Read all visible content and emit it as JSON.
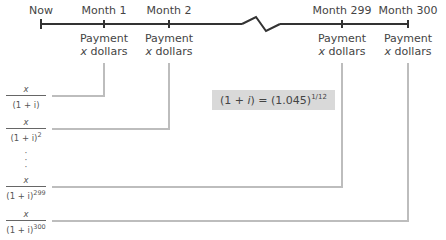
{
  "timeline": {
    "points": [
      {
        "label": "Now"
      },
      {
        "label": "Month 1",
        "payment": "Payment",
        "amount": "dollars",
        "var": "x"
      },
      {
        "label": "Month 2",
        "payment": "Payment",
        "amount": "dollars",
        "var": "x"
      },
      {
        "label": "Month 299",
        "payment": "Payment",
        "amount": "dollars",
        "var": "x"
      },
      {
        "label": "Month 300",
        "payment": "Payment",
        "amount": "dollars",
        "var": "x"
      }
    ]
  },
  "present_values": [
    {
      "numerator": "x",
      "denominator": "(1 + i)",
      "exponent": ""
    },
    {
      "numerator": "x",
      "denominator": "(1 + i)",
      "exponent": "2"
    },
    {
      "numerator": "x",
      "denominator": "(1 + i)",
      "exponent": "299"
    },
    {
      "numerator": "x",
      "denominator": "(1 + i)",
      "exponent": "300"
    }
  ],
  "equation": {
    "lhs_open": "(1 + ",
    "lhs_var": "i",
    "lhs_close": ") = (1.045)",
    "exponent": "1/12"
  },
  "colors": {
    "timeline": "#333333",
    "connector": "#bdbdbd",
    "equation_bg": "#d9d9d9"
  }
}
